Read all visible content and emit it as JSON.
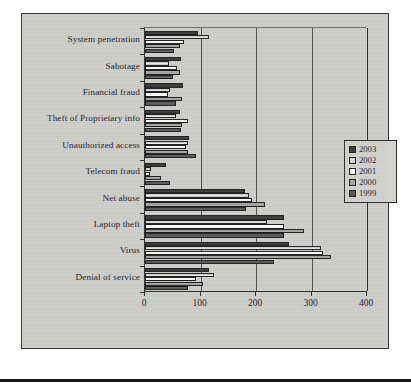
{
  "chart_data": {
    "type": "bar",
    "orientation": "horizontal",
    "title": "",
    "xlabel": "",
    "ylabel": "",
    "xlim": [
      0,
      400
    ],
    "xticks": [
      0,
      100,
      200,
      300,
      400
    ],
    "grid": "vertical",
    "legend_position": "right",
    "categories": [
      "Denial of service",
      "Virus",
      "Laptop theft",
      "Net abuse",
      "Telecom fraud",
      "Unauthorized access",
      "Theft of Proprietary info",
      "Financial fraud",
      "Sabotage",
      "System penetration"
    ],
    "series": [
      {
        "name": "2003",
        "color": "#3a3a3a",
        "values": [
          115,
          260,
          251,
          180,
          37,
          80,
          63,
          68,
          64,
          95
        ]
      },
      {
        "name": "2002",
        "color": "#e9e9e6",
        "values": [
          125,
          318,
          220,
          187,
          10,
          78,
          55,
          45,
          43,
          115
        ]
      },
      {
        "name": "2001",
        "color": "#fbfbf8",
        "values": [
          91,
          320,
          250,
          193,
          9,
          73,
          77,
          42,
          58,
          70
        ]
      },
      {
        "name": "2000",
        "color": "#a6a6a2",
        "values": [
          105,
          335,
          287,
          216,
          29,
          78,
          67,
          67,
          63,
          63
        ]
      },
      {
        "name": "1999",
        "color": "#585856",
        "values": [
          78,
          232,
          250,
          182,
          45,
          91,
          65,
          56,
          51,
          53
        ]
      }
    ],
    "legend": [
      {
        "label": "2003",
        "color": "#3a3a3a"
      },
      {
        "label": "2002",
        "color": "#e9e9e6"
      },
      {
        "label": "2001",
        "color": "#fbfbf8"
      },
      {
        "label": "2000",
        "color": "#a6a6a2"
      },
      {
        "label": "1999",
        "color": "#585856"
      }
    ]
  }
}
